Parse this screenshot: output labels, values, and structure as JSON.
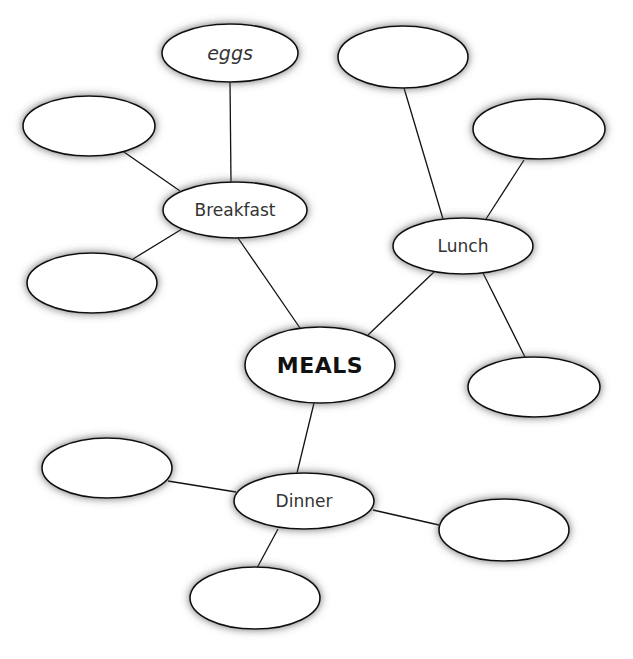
{
  "diagram": {
    "type": "mind-map",
    "center": {
      "id": "meals",
      "label": "MEALS",
      "cx": 320,
      "cy": 365,
      "rx": 75,
      "ry": 38
    },
    "nodes": [
      {
        "id": "breakfast",
        "label": "Breakfast",
        "cx": 235,
        "cy": 210,
        "rx": 72,
        "ry": 28
      },
      {
        "id": "lunch",
        "label": "Lunch",
        "cx": 463,
        "cy": 246,
        "rx": 70,
        "ry": 28
      },
      {
        "id": "dinner",
        "label": "Dinner",
        "cx": 304,
        "cy": 501,
        "rx": 70,
        "ry": 28
      },
      {
        "id": "eggs",
        "label": "eggs",
        "cx": 230,
        "cy": 53,
        "rx": 68,
        "ry": 29
      },
      {
        "id": "breakfast-blank-1",
        "label": "",
        "cx": 89,
        "cy": 126,
        "rx": 66,
        "ry": 30
      },
      {
        "id": "breakfast-blank-2",
        "label": "",
        "cx": 92,
        "cy": 283,
        "rx": 65,
        "ry": 30
      },
      {
        "id": "lunch-blank-1",
        "label": "",
        "cx": 403,
        "cy": 57,
        "rx": 65,
        "ry": 31
      },
      {
        "id": "lunch-blank-2",
        "label": "",
        "cx": 539,
        "cy": 129,
        "rx": 66,
        "ry": 30
      },
      {
        "id": "lunch-blank-3",
        "label": "",
        "cx": 534,
        "cy": 387,
        "rx": 66,
        "ry": 30
      },
      {
        "id": "dinner-blank-1",
        "label": "",
        "cx": 107,
        "cy": 468,
        "rx": 65,
        "ry": 30
      },
      {
        "id": "dinner-blank-2",
        "label": "",
        "cx": 504,
        "cy": 530,
        "rx": 65,
        "ry": 31
      },
      {
        "id": "dinner-blank-3",
        "label": "",
        "cx": 255,
        "cy": 598,
        "rx": 65,
        "ry": 31
      }
    ],
    "edges": [
      {
        "from": "meals",
        "to": "breakfast",
        "x1": 300,
        "y1": 328,
        "x2": 238,
        "y2": 238
      },
      {
        "from": "meals",
        "to": "lunch",
        "x1": 368,
        "y1": 335,
        "x2": 434,
        "y2": 272
      },
      {
        "from": "meals",
        "to": "dinner",
        "x1": 314,
        "y1": 403,
        "x2": 297,
        "y2": 473
      },
      {
        "from": "breakfast",
        "to": "eggs",
        "x1": 231,
        "y1": 182,
        "x2": 230,
        "y2": 82
      },
      {
        "from": "breakfast",
        "to": "breakfast-blank-1",
        "x1": 180,
        "y1": 191,
        "x2": 124,
        "y2": 152
      },
      {
        "from": "breakfast",
        "to": "breakfast-blank-2",
        "x1": 182,
        "y1": 229,
        "x2": 133,
        "y2": 259
      },
      {
        "from": "lunch",
        "to": "lunch-blank-1",
        "x1": 443,
        "y1": 219,
        "x2": 404,
        "y2": 88
      },
      {
        "from": "lunch",
        "to": "lunch-blank-2",
        "x1": 486,
        "y1": 219,
        "x2": 524,
        "y2": 160
      },
      {
        "from": "lunch",
        "to": "lunch-blank-3",
        "x1": 483,
        "y1": 273,
        "x2": 525,
        "y2": 357
      },
      {
        "from": "dinner",
        "to": "dinner-blank-1",
        "x1": 236,
        "y1": 492,
        "x2": 168,
        "y2": 481
      },
      {
        "from": "dinner",
        "to": "dinner-blank-2",
        "x1": 373,
        "y1": 510,
        "x2": 439,
        "y2": 525
      },
      {
        "from": "dinner",
        "to": "dinner-blank-3",
        "x1": 278,
        "y1": 529,
        "x2": 257,
        "y2": 568
      }
    ],
    "colors": {
      "stroke": "#111111",
      "fill": "#ffffff",
      "shadow": "#555555",
      "text": "#333333"
    }
  }
}
